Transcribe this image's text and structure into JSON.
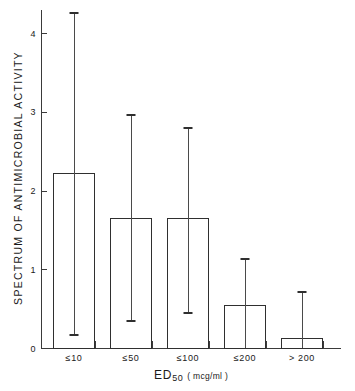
{
  "chart_data": {
    "type": "bar",
    "title": "",
    "subtitle": "",
    "xlabel": "ED50 ( mcg/ml )",
    "xlabel_main": "ED",
    "xlabel_sub": "50",
    "xlabel_units": "( mcg/ml )",
    "ylabel": "SPECTRUM OF ANTIMICROBIAL ACTIVITY",
    "categories": [
      "≤10",
      "≤50",
      "≤100",
      "≤200",
      "> 200"
    ],
    "values": [
      2.22,
      1.65,
      1.65,
      0.55,
      0.13
    ],
    "error_upper": [
      4.27,
      2.97,
      2.81,
      1.14,
      0.72
    ],
    "error_lower": [
      0.18,
      0.35,
      0.46,
      0.0,
      0.0
    ],
    "ylim": [
      0,
      4.3
    ],
    "yticks": [
      0,
      1,
      2,
      3,
      4
    ],
    "ytick_labels": [
      "0",
      "1",
      "2",
      "3",
      "4"
    ],
    "grid": false,
    "legend": null,
    "bar_fill": "#ffffff",
    "bar_stroke": "#2f2f2f",
    "axis_color": "#3a3a3a"
  },
  "corner": ""
}
